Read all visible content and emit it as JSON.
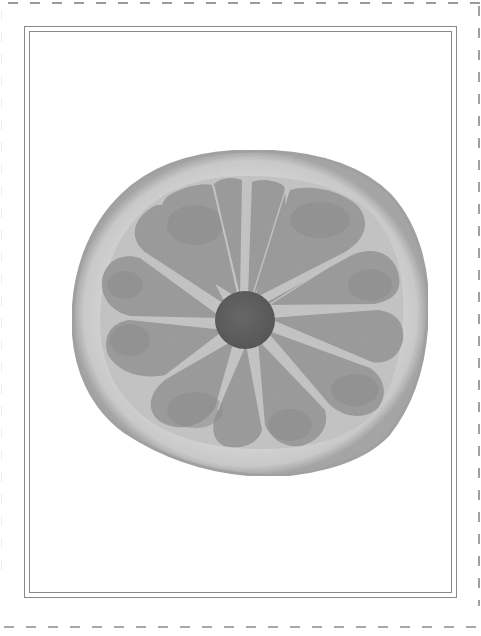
{
  "image": {
    "subject": "citrus-slice",
    "description": "Grayscale cross-section of a citrus fruit slice showing rind, segments and dark central core",
    "colors": {
      "background": "#ffffff",
      "frame": "#8a8a8a",
      "dashed_border": "#9a9a9a",
      "rind_outer": "#a9a9a9",
      "rind_pith": "#d6d6d6",
      "segment": "#9c9c9c",
      "segment_dark": "#8f8f8f",
      "membrane": "#c4c4c4",
      "core": "#5e5e5e"
    },
    "segment_count": 12
  }
}
